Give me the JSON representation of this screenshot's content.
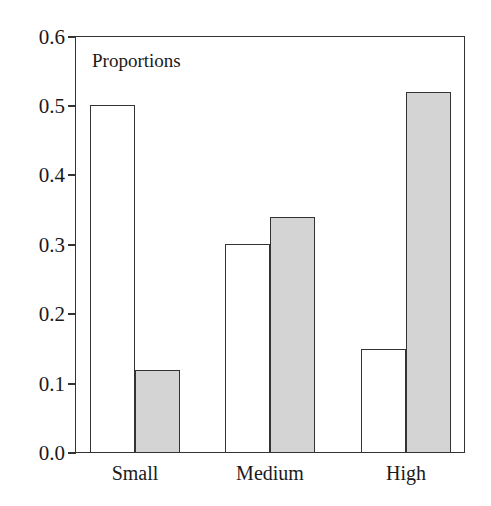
{
  "chart_data": {
    "type": "bar",
    "title": "",
    "annotation": "Proportions",
    "xlabel": "",
    "ylabel": "",
    "ylim": [
      0.0,
      0.6
    ],
    "yticks": [
      "0.0",
      "0.1",
      "0.2",
      "0.3",
      "0.4",
      "0.5",
      "0.6"
    ],
    "categories": [
      "Small",
      "Medium",
      "High"
    ],
    "series": [
      {
        "name": "white",
        "color": "#ffffff",
        "values": [
          0.5,
          0.3,
          0.15
        ]
      },
      {
        "name": "gray",
        "color": "#d4d4d4",
        "values": [
          0.12,
          0.34,
          0.52
        ]
      }
    ],
    "grid": false,
    "legend": "none"
  }
}
